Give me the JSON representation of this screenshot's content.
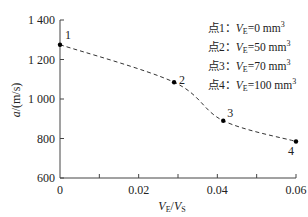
{
  "chart_data": {
    "type": "line",
    "title": "",
    "xlabel": "V_E/V_S",
    "ylabel": "a/(m/s)",
    "xlim": [
      0,
      0.06
    ],
    "ylim": [
      600,
      1400
    ],
    "x_ticks": [
      "0",
      "0.02",
      "0.04",
      "0.06"
    ],
    "y_ticks": [
      "600",
      "800",
      "1 000",
      "1 200",
      "1 400"
    ],
    "grid": false,
    "line_style": "dashed",
    "series": [
      {
        "name": "a vs V_E/V_S",
        "x": [
          0,
          0.029,
          0.0415,
          0.06
        ],
        "y": [
          1275,
          1085,
          890,
          785
        ],
        "point_labels": [
          "1",
          "2",
          "3",
          "4"
        ]
      }
    ],
    "legend": [
      {
        "label": "点1：",
        "var": "V",
        "sub": "E",
        "value": "=0 mm",
        "sup": "3"
      },
      {
        "label": "点2：",
        "var": "V",
        "sub": "E",
        "value": "=50 mm",
        "sup": "3"
      },
      {
        "label": "点3：",
        "var": "V",
        "sub": "E",
        "value": "=70 mm",
        "sup": "3"
      },
      {
        "label": "点4：",
        "var": "V",
        "sub": "E",
        "value": "=100 mm",
        "sup": "3"
      }
    ],
    "legend_position": "upper right"
  }
}
